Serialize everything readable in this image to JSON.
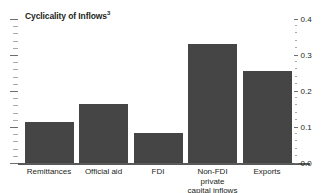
{
  "chart_data": {
    "type": "bar",
    "title": "Cyclicality of Inflows",
    "title_footnote": "3",
    "xlabel": "",
    "ylabel": "",
    "ylim": [
      0.0,
      0.4
    ],
    "y_axis_position": "right",
    "grid": false,
    "bar_color": "#454545",
    "axis_color": "#58595b",
    "categories": [
      "Remittances",
      "Official aid",
      "FDI",
      "Non-FDI private capital inflows",
      "Exports"
    ],
    "category_lines": [
      [
        "Remittances"
      ],
      [
        "Official aid"
      ],
      [
        "FDI"
      ],
      [
        "Non-FDI private",
        "capital inflows"
      ],
      [
        "Exports"
      ]
    ],
    "values": [
      0.115,
      0.165,
      0.083,
      0.33,
      0.255
    ],
    "ytick_labels": [
      "0.0",
      "0.1",
      "0.2",
      "0.3",
      "0.4"
    ],
    "ytick_values": [
      0.0,
      0.1,
      0.2,
      0.3,
      0.4
    ]
  }
}
